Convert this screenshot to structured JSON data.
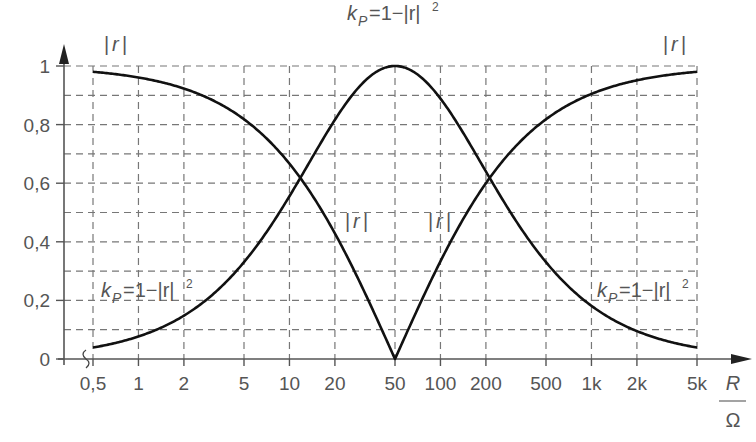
{
  "chart_data": {
    "type": "line",
    "title": "",
    "xlabel": "R / Ω",
    "xlabel_num": "R",
    "xlabel_den": "Ω",
    "ylabel": "",
    "x_scale": "log",
    "xlim": [
      0.5,
      5000
    ],
    "ylim": [
      0,
      1
    ],
    "grid": true,
    "x_ticks": [
      0.5,
      1,
      2,
      5,
      10,
      20,
      50,
      100,
      200,
      500,
      1000,
      2000,
      5000
    ],
    "x_tick_labels": [
      "0,5",
      "1",
      "2",
      "5",
      "10",
      "20",
      "50",
      "100",
      "200",
      "500",
      "1k",
      "2k",
      "5k"
    ],
    "y_ticks": [
      0,
      0.2,
      0.4,
      0.6,
      0.8,
      1
    ],
    "y_tick_labels": [
      "0",
      "0,2",
      "0,4",
      "0,6",
      "0,8",
      "1"
    ],
    "reference_impedance": 50,
    "series": [
      {
        "name": "|r|",
        "formula": "|r| = |R - 50| / (R + 50)",
        "x": [
          0.5,
          1,
          2,
          5,
          10,
          20,
          50,
          100,
          200,
          500,
          1000,
          2000,
          5000
        ],
        "values": [
          0.98,
          0.961,
          0.923,
          0.818,
          0.667,
          0.429,
          0.0,
          0.333,
          0.6,
          0.818,
          0.905,
          0.951,
          0.98
        ]
      },
      {
        "name": "k_P = 1 - |r|^2",
        "formula": "k_P = 1 - |r|^2",
        "x": [
          0.5,
          1,
          2,
          5,
          10,
          20,
          50,
          100,
          200,
          500,
          1000,
          2000,
          5000
        ],
        "values": [
          0.039,
          0.077,
          0.148,
          0.331,
          0.556,
          0.816,
          1.0,
          0.889,
          0.64,
          0.331,
          0.181,
          0.095,
          0.039
        ]
      }
    ],
    "annotations": [
      {
        "text": "|r|",
        "position": "top-left"
      },
      {
        "text": "k_P=1−|r|²",
        "position": "top-center"
      },
      {
        "text": "|r|",
        "position": "top-right"
      },
      {
        "text": "|r|",
        "position": "center-left-of-50"
      },
      {
        "text": "|r|",
        "position": "center-right-of-50"
      },
      {
        "text": "k_P=1−|r|²",
        "position": "bottom-left"
      },
      {
        "text": "k_P=1−|r|²",
        "position": "bottom-right"
      }
    ]
  },
  "labels": {
    "r_abs": "|r|",
    "r_sym": "r",
    "bar": "|",
    "k": "k",
    "k_sub": "P",
    "kp_rest": "=1−|r|",
    "sq": "2"
  }
}
